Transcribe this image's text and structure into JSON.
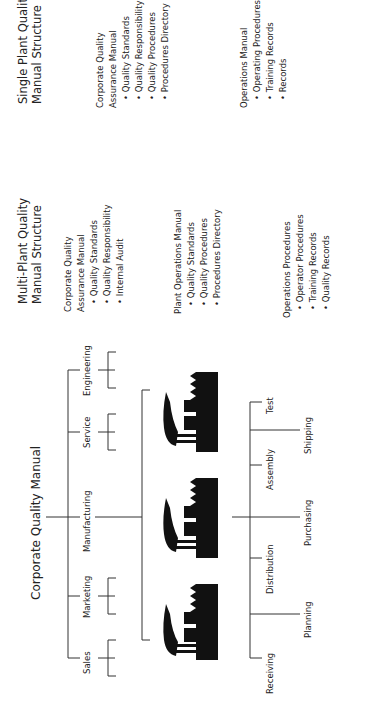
{
  "single_plant": {
    "title_line1": "Single Plant Quality",
    "title_line2": "Manual Structure",
    "corporate": {
      "heading_line1": "Corporate Quality",
      "heading_line2": "Assurance Manual",
      "items": [
        "Quality Standards",
        "Quality Responsibility",
        "Quality Procedures",
        "Procedures Directory"
      ]
    },
    "operations": {
      "heading": "Operations Manual",
      "items": [
        "Operating Procedures",
        "Training Records",
        "Records"
      ]
    }
  },
  "multi_plant": {
    "title_line1": "Multi-Plant Quality",
    "title_line2": "Manual Structure",
    "corporate": {
      "heading_line1": "Corporate Quality",
      "heading_line2": "Assurance Manual",
      "items": [
        "Quality Standards",
        "Quality Responsibility",
        "Internal Audit"
      ]
    },
    "plant_operations": {
      "heading": "Plant Operations Manual",
      "items": [
        "Quality Standards",
        "Quality Procedures",
        "Procedures Directory"
      ]
    },
    "operations_procedures": {
      "heading": "Operations Procedures",
      "items": [
        "Operator Procedures",
        "Training Records",
        "Quality Records"
      ]
    }
  },
  "org_chart": {
    "root": "Corporate Quality Manual",
    "departments": [
      "Engineering",
      "Service",
      "Manufacturing",
      "Marketing",
      "Sales"
    ],
    "plants": 3,
    "processes_short": [
      "Test",
      "Assembly",
      "Distribution",
      "Receiving"
    ],
    "processes_long": [
      "Shipping",
      "Purchasing",
      "Planning"
    ]
  },
  "colors": {
    "line": "#333333",
    "factory": "#111111",
    "text": "#222222"
  }
}
